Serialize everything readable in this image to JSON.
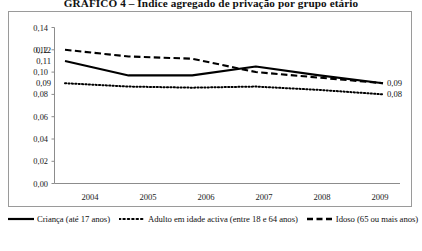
{
  "chart_data": {
    "type": "line",
    "title": "GRÁFICO 4 – Índice agregado de privação por grupo etário",
    "xlabel": "",
    "ylabel": "",
    "x": [
      "2004",
      "2005",
      "2006",
      "2007",
      "2008",
      "2009"
    ],
    "categories": [
      "2004",
      "2005",
      "2006",
      "2007",
      "2008",
      "2009"
    ],
    "ylim": [
      0.0,
      0.14
    ],
    "ytick_labels": [
      "0,14",
      "0,12",
      "0,10",
      "0,08",
      "0,06",
      "0,04",
      "0,02",
      "0,00"
    ],
    "ytick_values": [
      0.14,
      0.12,
      0.1,
      0.08,
      0.06,
      0.04,
      0.02,
      0.0
    ],
    "grid": false,
    "legend_position": "bottom",
    "series": [
      {
        "name": "Criança (até 17 anos)",
        "style": "solid",
        "values": [
          0.11,
          0.097,
          0.097,
          0.105,
          0.097,
          0.09
        ],
        "start_label": "0,11",
        "end_label": "0,09"
      },
      {
        "name": "Adulto em idade activa (entre 18 e 64 anos)",
        "style": "dotted",
        "values": [
          0.09,
          0.087,
          0.086,
          0.087,
          0.084,
          0.08
        ],
        "start_label": "0,09",
        "end_label": "0,08"
      },
      {
        "name": "Idoso (65 ou mais anos)",
        "style": "dashed",
        "values": [
          0.12,
          0.114,
          0.112,
          0.1,
          0.095,
          0.09
        ],
        "start_label": "0,12",
        "end_label": "0,09"
      }
    ],
    "annotations": [
      {
        "text": "0,12",
        "anchor": "start-idoso"
      },
      {
        "text": "0,11",
        "anchor": "start-crianca"
      },
      {
        "text": "0,09",
        "anchor": "start-adulto"
      },
      {
        "text": "0,09",
        "anchor": "end-crianca-idoso"
      },
      {
        "text": "0,08",
        "anchor": "end-adulto"
      }
    ]
  },
  "axis": {
    "y_labels": [
      "0,14",
      "0,12",
      "0,10",
      "0,08",
      "0,06",
      "0,04",
      "0,02",
      "0,00"
    ],
    "x_labels": [
      "2004",
      "2005",
      "2006",
      "2007",
      "2008",
      "2009"
    ]
  },
  "labels": {
    "start_idoso": "0,12",
    "start_crianca": "0,11",
    "start_adulto": "0,09",
    "end_crianca_idoso": "0,09",
    "end_adulto": "0,08"
  },
  "legend": {
    "items": [
      {
        "label": "Criança (até 17 anos)",
        "style": "solid"
      },
      {
        "label": "Adulto em idade activa (entre 18 e 64 anos)",
        "style": "dotted"
      },
      {
        "label": "Idoso (65 ou mais anos)",
        "style": "dashed"
      }
    ]
  }
}
